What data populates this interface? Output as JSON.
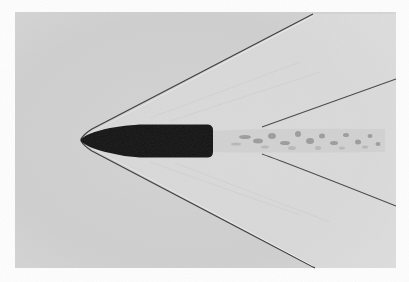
{
  "image": {
    "description": "Shadowgraph photograph of a bullet in supersonic flight showing bow shock, tail shock and turbulent wake",
    "background_color": "#ffffff",
    "photo_tone": "#d2d2d2",
    "bullet_color": "#111111",
    "shock_color": "#3a3a3a",
    "highlight_color": "#f2f2f2"
  }
}
